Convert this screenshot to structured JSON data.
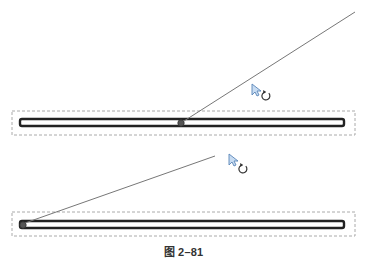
{
  "figure": {
    "caption": "图 2–81",
    "background": "#ffffff"
  },
  "colors": {
    "bar_outline": "#222222",
    "bar_fill": "#ffffff",
    "selection_dash": "#aaaaaa",
    "rotate_line": "#777777",
    "cursor_fill": "#c8dcf2",
    "cursor_stroke": "#5a86b8",
    "rotate_icon": "#333333",
    "pivot": "#555555"
  },
  "panels": [
    {
      "name": "top",
      "selection_box": {
        "x": 12,
        "y": 111,
        "w": 343,
        "h": 24
      },
      "bar": {
        "x": 20,
        "y": 119,
        "w": 324,
        "h": 7
      },
      "pivot": {
        "x": 181,
        "y": 123,
        "label": "center-pivot"
      },
      "rotate_line": {
        "x1": 184,
        "y1": 121,
        "x2": 355,
        "y2": 12
      },
      "cursor": {
        "x": 252,
        "y": 84
      },
      "rotate_icon": {
        "x": 266,
        "y": 96
      }
    },
    {
      "name": "bottom",
      "selection_box": {
        "x": 12,
        "y": 212,
        "w": 343,
        "h": 24
      },
      "bar": {
        "x": 20,
        "y": 221,
        "w": 324,
        "h": 7
      },
      "pivot": {
        "x": 23,
        "y": 225,
        "label": "end-pivot"
      },
      "rotate_line": {
        "x1": 25,
        "y1": 223,
        "x2": 215,
        "y2": 156
      },
      "cursor": {
        "x": 229,
        "y": 154
      },
      "rotate_icon": {
        "x": 243,
        "y": 169
      }
    }
  ]
}
